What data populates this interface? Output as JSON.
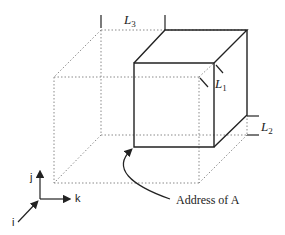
{
  "diagram": {
    "labels": {
      "L3": {
        "base": "L",
        "sub": "3"
      },
      "L1": {
        "base": "L",
        "sub": "1"
      },
      "L2": {
        "base": "L",
        "sub": "2"
      },
      "address": "Address of A"
    },
    "axes": {
      "i": "i",
      "j": "j",
      "k": "k"
    },
    "colors": {
      "solid": "#222222",
      "dotted": "#8a8a8a"
    }
  }
}
